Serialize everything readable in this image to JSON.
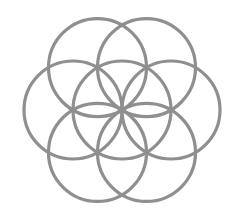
{
  "figure": {
    "stroke_color": "#8f8f8f",
    "stroke_width": 3.2,
    "background": "#ffffff",
    "radius": 49,
    "center": [
      122,
      110
    ],
    "circles": [
      {
        "name": "center",
        "cx": 122,
        "cy": 110
      },
      {
        "name": "top-left",
        "cx": 97.5,
        "cy": 67.6
      },
      {
        "name": "top-right",
        "cx": 146.5,
        "cy": 67.6
      },
      {
        "name": "right",
        "cx": 171,
        "cy": 110
      },
      {
        "name": "bottom-right",
        "cx": 146.5,
        "cy": 152.4
      },
      {
        "name": "bottom-left",
        "cx": 97.5,
        "cy": 152.4
      },
      {
        "name": "left",
        "cx": 73,
        "cy": 110
      }
    ]
  }
}
